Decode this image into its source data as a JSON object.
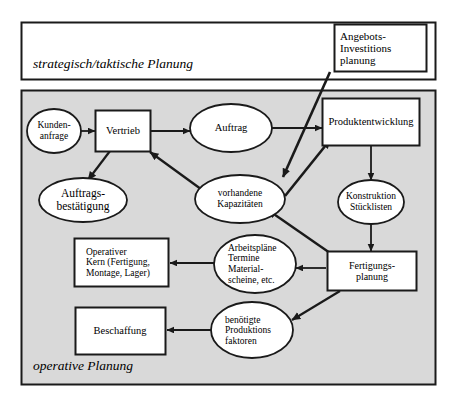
{
  "diagram": {
    "zones": [
      {
        "id": "strategic",
        "label": "strategisch/taktische Planung",
        "fill": "#ffffff",
        "stroke": "#1a1a1a"
      },
      {
        "id": "operative",
        "label": "operative Planung",
        "fill": "#d9d9d9",
        "stroke": "#1a1a1a"
      }
    ],
    "nodes": [
      {
        "id": "angebots",
        "shape": "rect",
        "label": "Angebots-\nInvestitions\nplanung",
        "align": "left"
      },
      {
        "id": "kundenanfrage",
        "shape": "ellipse",
        "label": "Kunden-\nanfrage",
        "align": "center"
      },
      {
        "id": "vertrieb",
        "shape": "rect",
        "label": "Vertrieb",
        "align": "center"
      },
      {
        "id": "auftrag",
        "shape": "ellipse",
        "label": "Auftrag",
        "align": "center"
      },
      {
        "id": "produktentwicklung",
        "shape": "rect",
        "label": "Produktentwicklung",
        "align": "center"
      },
      {
        "id": "auftragsbestaetigung",
        "shape": "ellipse",
        "label": "Auftrags-\nbestätigung",
        "align": "center"
      },
      {
        "id": "kapazitaeten",
        "shape": "ellipse",
        "label": "vorhandene\nKapazitäten",
        "align": "center"
      },
      {
        "id": "konstruktion",
        "shape": "ellipse",
        "label": "Konstruktion\nStücklisten",
        "align": "center"
      },
      {
        "id": "operativerkern",
        "shape": "rect",
        "label": "Operativer\nKern (Fertigung,\nMontage, Lager)",
        "align": "left"
      },
      {
        "id": "arbeitsplaene",
        "shape": "ellipse",
        "label": "Arbeitspläne\nTermine\nMaterial-\nscheine, etc.",
        "align": "left"
      },
      {
        "id": "fertigungsplanung",
        "shape": "rect",
        "label": "Fertigungs-\nplanung",
        "align": "center"
      },
      {
        "id": "beschaffung",
        "shape": "rect",
        "label": "Beschaffung",
        "align": "center"
      },
      {
        "id": "produktionsfaktoren",
        "shape": "ellipse",
        "label": "benötigte\nProduktions\nfaktoren",
        "align": "left"
      }
    ],
    "edges": [
      {
        "from": "kundenanfrage",
        "to": "vertrieb"
      },
      {
        "from": "vertrieb",
        "to": "auftrag"
      },
      {
        "from": "vertrieb",
        "to": "auftragsbestaetigung"
      },
      {
        "from": "auftrag",
        "to": "produktentwicklung"
      },
      {
        "from": "angebots",
        "to": "kapazitaeten"
      },
      {
        "from": "kapazitaeten",
        "to": "produktentwicklung"
      },
      {
        "from": "kapazitaeten",
        "to": "vertrieb"
      },
      {
        "from": "produktentwicklung",
        "to": "konstruktion"
      },
      {
        "from": "konstruktion",
        "to": "fertigungsplanung"
      },
      {
        "from": "fertigungsplanung",
        "to": "kapazitaeten"
      },
      {
        "from": "fertigungsplanung",
        "to": "arbeitsplaene"
      },
      {
        "from": "fertigungsplanung",
        "to": "produktionsfaktoren"
      },
      {
        "from": "arbeitsplaene",
        "to": "operativerkern"
      },
      {
        "from": "produktionsfaktoren",
        "to": "beschaffung"
      }
    ],
    "colors": {
      "stroke": "#1a1a1a",
      "node_fill": "#ffffff",
      "zone_operative_fill": "#d9d9d9",
      "text": "#000000"
    }
  }
}
